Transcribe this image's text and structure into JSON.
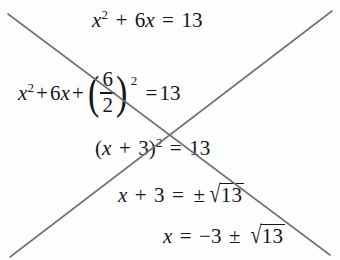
{
  "document": {
    "kind": "math-worksheet",
    "topic": "completing-the-square",
    "marked_incorrect": true,
    "ink_color": "#14161c",
    "strike_color": "#6f7478",
    "background_color": "#fefefe"
  },
  "equations": [
    {
      "id": "line-1",
      "plain": "x^2 + 6x = 13",
      "parts": {
        "var": "x",
        "sup": "2",
        "plus": "+",
        "coef_term": "6",
        "var2": "x",
        "equals": "=",
        "rhs": "13"
      }
    },
    {
      "id": "line-2",
      "plain": "x^2 + 6x + (6/2)^2 = 13",
      "parts": {
        "var": "x",
        "sup": "2",
        "plus1": "+",
        "coef_term": "6",
        "var2": "x",
        "plus2": "+",
        "paren_open": "(",
        "numerator": "6",
        "denominator": "2",
        "paren_close": ")",
        "paren_sup": "2",
        "equals": "=",
        "rhs": "13"
      }
    },
    {
      "id": "line-3",
      "plain": "(x + 3)^2 = 13",
      "parts": {
        "paren_open": "(",
        "var": "x",
        "plus": "+",
        "const": "3",
        "paren_close": ")",
        "sup": "2",
        "equals": "=",
        "rhs": "13"
      }
    },
    {
      "id": "line-4",
      "plain": "x + 3 = ±sqrt(13)",
      "parts": {
        "var": "x",
        "plus": "+",
        "const": "3",
        "equals": "=",
        "plusminus": "±",
        "radical_sign": "√",
        "radicand": "13"
      }
    },
    {
      "id": "line-5",
      "plain": "x = -3 ± sqrt(13)",
      "parts": {
        "var": "x",
        "equals": "=",
        "minus": "−3",
        "plusminus": "±",
        "radical_sign": "√",
        "radicand": "13"
      }
    }
  ],
  "strike_marks": {
    "name": "x-cross-out",
    "stroke_color": "#6f7478",
    "stroke_width": 1.6,
    "lines": [
      {
        "name": "stroke-down-right",
        "x1": 8,
        "y1": 14,
        "x2": 330,
        "y2": 255
      },
      {
        "name": "stroke-up-right",
        "x1": 10,
        "y1": 257,
        "x2": 332,
        "y2": 11
      }
    ]
  }
}
